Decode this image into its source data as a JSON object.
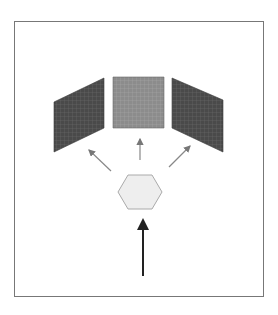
{
  "diagram": {
    "frame": {
      "x": 14.5,
      "y": 21.5,
      "w": 249,
      "h": 275,
      "stroke": "#777777"
    },
    "panels": [
      {
        "name": "left-panel",
        "points": "54,102 104,78 104,128 54,152",
        "fill": "#4a4a4a",
        "grid": "#6a6a6a"
      },
      {
        "name": "center-panel",
        "points": "113,77 164,77 164,128 113,128",
        "fill": "#8c8c8c",
        "grid": "#a8a8a8"
      },
      {
        "name": "right-panel",
        "points": "172,78 223,100 223,152 172,128",
        "fill": "#4a4a4a",
        "grid": "#666666"
      }
    ],
    "hexagon": {
      "points": "128,175 152,175 162,192 152,209 128,209 118,192",
      "fill": "#eeeeee",
      "stroke": "#aaaaaa"
    },
    "small_arrows": [
      {
        "name": "arrow-to-left-panel",
        "x1": 111,
        "y1": 171,
        "x2": 89,
        "y2": 150
      },
      {
        "name": "arrow-to-center-panel",
        "x1": 140,
        "y1": 160,
        "x2": 140,
        "y2": 139
      },
      {
        "name": "arrow-to-right-panel",
        "x1": 169,
        "y1": 167,
        "x2": 190,
        "y2": 146
      }
    ],
    "input_arrow": {
      "x1": 143,
      "y1": 276,
      "x2": 143,
      "y2": 218,
      "stroke": "#222222"
    },
    "colors": {
      "arrow_gray": "#888888",
      "input_arrow": "#222222"
    }
  }
}
